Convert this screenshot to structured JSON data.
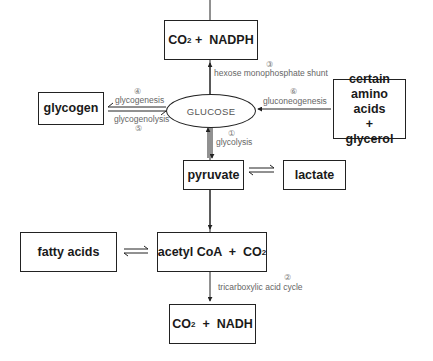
{
  "nodes": {
    "co2_nadph": {
      "part1": "CO",
      "sub": "2",
      "part2": " +  NADPH"
    },
    "glucose": "GLUCOSE",
    "glycogen": "glycogen",
    "amino_glycerol": {
      "line1": "certain",
      "line2": "amino acids",
      "line3": "+",
      "line4": "glycerol"
    },
    "pyruvate": "pyruvate",
    "lactate": "lactate",
    "fatty_acids": "fatty acids",
    "acetyl_coa": {
      "part1": "acetyl CoA  +  CO",
      "sub": "2"
    },
    "co2_nadh": {
      "part1": "CO",
      "sub": "2",
      "part2": "  +  NADH"
    }
  },
  "pathways": {
    "glycolysis": {
      "number": "①",
      "label": "glycolysis"
    },
    "tca": {
      "number": "②",
      "label": "tricarboxylic acid cycle"
    },
    "hmp": {
      "number": "③",
      "label": "hexose monophosphate shunt"
    },
    "glycogenesis": {
      "number": "④",
      "label": "glycogenesis"
    },
    "glycogenolysis": {
      "number": "⑤",
      "label": "glycogenolysis"
    },
    "gluconeogenesis": {
      "number": "⑥",
      "label": "gluconeogenesis"
    }
  },
  "colors": {
    "line": "#222222",
    "label": "#666666"
  }
}
